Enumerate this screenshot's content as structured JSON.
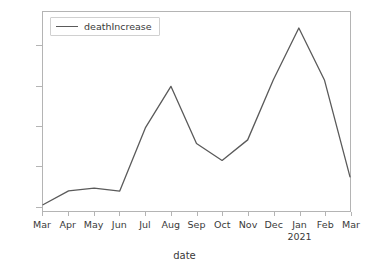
{
  "chart_data": {
    "type": "line",
    "title": "",
    "xlabel": "date",
    "ylabel": "",
    "grid": false,
    "legend_position": "upper left",
    "categories": [
      "Mar",
      "Apr",
      "May",
      "Jun",
      "Jul",
      "Aug",
      "Sep",
      "Oct",
      "Nov",
      "Dec",
      "Jan",
      "Feb",
      "Mar"
    ],
    "category_sublabels": [
      "",
      "",
      "",
      "",
      "",
      "",
      "",
      "",
      "",
      "",
      "2021",
      "",
      ""
    ],
    "xtick_labels": [
      "Mar",
      "Apr",
      "May",
      "Jun",
      "Jul",
      "Aug",
      "Sep",
      "Oct",
      "Nov",
      "Dec",
      "Jan",
      "Feb",
      "Mar"
    ],
    "ytick_labels": [
      "0",
      "2000",
      "4000",
      "6000",
      "8000"
    ],
    "yticks": [
      0,
      2000,
      4000,
      6000,
      8000
    ],
    "ylim": [
      -260,
      9700
    ],
    "xlim": [
      0,
      12
    ],
    "series": [
      {
        "name": "deathIncrease",
        "color": "#5a5a5a",
        "values": [
          50,
          750,
          880,
          740,
          3900,
          5980,
          3120,
          2270,
          3300,
          6300,
          8900,
          6300,
          1450
        ]
      }
    ]
  },
  "legend": {
    "entries": [
      {
        "label": "deathIncrease",
        "color": "#5a5a5a"
      }
    ]
  },
  "axes": {
    "xlabel": "date",
    "spine_color": "#b4b4b4",
    "tick_text_color": "#3a3a3a"
  }
}
